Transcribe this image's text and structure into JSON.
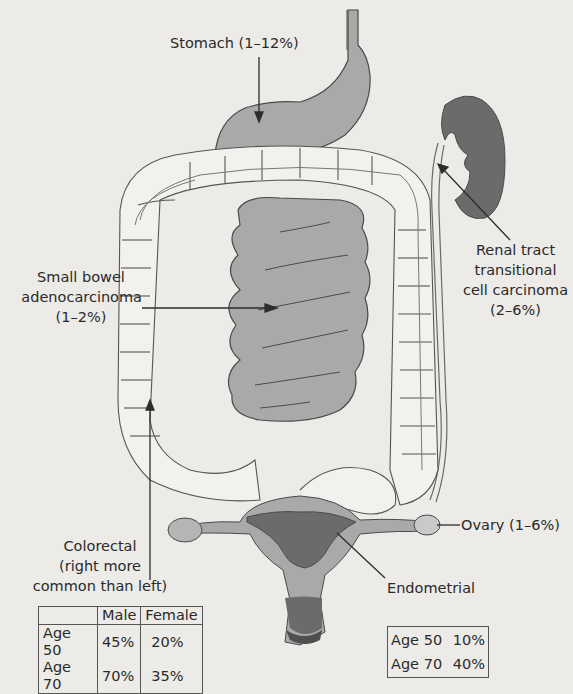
{
  "diagram": {
    "labels": {
      "stomach": "Stomach (1–12%)",
      "small_bowel": [
        "Small bowel",
        "adenocarcinoma",
        "(1–2%)"
      ],
      "renal": [
        "Renal tract",
        "transitional",
        "cell carcinoma",
        "(2–6%)"
      ],
      "colorectal": [
        "Colorectal",
        "(right more",
        "common than left)"
      ],
      "ovary": "Ovary (1–6%)",
      "endometrial": "Endometrial"
    },
    "colorectal_table": {
      "headers": [
        "",
        "Male",
        "Female"
      ],
      "rows": [
        {
          "label": "Age 50",
          "male": "45%",
          "female": "20%"
        },
        {
          "label": "Age 70",
          "male": "70%",
          "female": "35%"
        }
      ]
    },
    "endometrial_table": {
      "rows": [
        {
          "label": "Age 50",
          "value": "10%"
        },
        {
          "label": "Age 70",
          "value": "40%"
        }
      ]
    },
    "colors": {
      "background": "#ecebe8",
      "organ_light": "#a9a9a9",
      "organ_dark": "#6b6b6b",
      "outline": "#4a4a4a",
      "colon_fill": "#f2f1ee"
    }
  }
}
